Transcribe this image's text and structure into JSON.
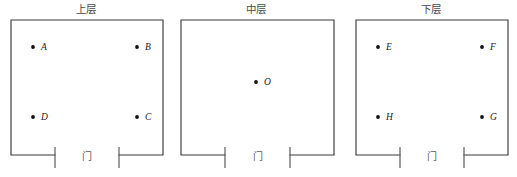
{
  "figure": {
    "width": 517,
    "height": 177,
    "background_color": "#ffffff",
    "line_color": "#3a3a3a",
    "dot_color": "#111111"
  },
  "panels": [
    {
      "id": "upper",
      "title": "上层",
      "door_label": "门",
      "left": 0,
      "width": 172,
      "room": {
        "x": 11,
        "y": 20,
        "w": 152,
        "h": 135
      },
      "door": {
        "gap_left": 55,
        "gap_right": 119,
        "jamb_top": 147,
        "jamb_bottom": 168
      },
      "door_label_pos": {
        "x": 87,
        "y": 157
      },
      "points": [
        {
          "name": "A",
          "x": 33,
          "y": 47,
          "label_dx": 8
        },
        {
          "name": "B",
          "x": 137,
          "y": 47,
          "label_dx": 8
        },
        {
          "name": "D",
          "x": 33,
          "y": 117,
          "label_dx": 8
        },
        {
          "name": "C",
          "x": 137,
          "y": 117,
          "label_dx": 8
        }
      ]
    },
    {
      "id": "middle",
      "title": "中层",
      "door_label": "门",
      "left": 170,
      "width": 172,
      "room": {
        "x": 11,
        "y": 20,
        "w": 153,
        "h": 135
      },
      "door": {
        "gap_left": 55,
        "gap_right": 120,
        "jamb_top": 147,
        "jamb_bottom": 168
      },
      "door_label_pos": {
        "x": 88,
        "y": 157
      },
      "points": [
        {
          "name": "O",
          "x": 86,
          "y": 82,
          "label_dx": 8
        }
      ]
    },
    {
      "id": "lower",
      "title": "下层",
      "door_label": "门",
      "left": 345,
      "width": 172,
      "room": {
        "x": 11,
        "y": 20,
        "w": 152,
        "h": 135
      },
      "door": {
        "gap_left": 55,
        "gap_right": 119,
        "jamb_top": 147,
        "jamb_bottom": 168
      },
      "door_label_pos": {
        "x": 87,
        "y": 157
      },
      "points": [
        {
          "name": "E",
          "x": 33,
          "y": 47,
          "label_dx": 8
        },
        {
          "name": "F",
          "x": 137,
          "y": 47,
          "label_dx": 8
        },
        {
          "name": "H",
          "x": 33,
          "y": 117,
          "label_dx": 8
        },
        {
          "name": "G",
          "x": 137,
          "y": 117,
          "label_dx": 8
        }
      ]
    }
  ]
}
